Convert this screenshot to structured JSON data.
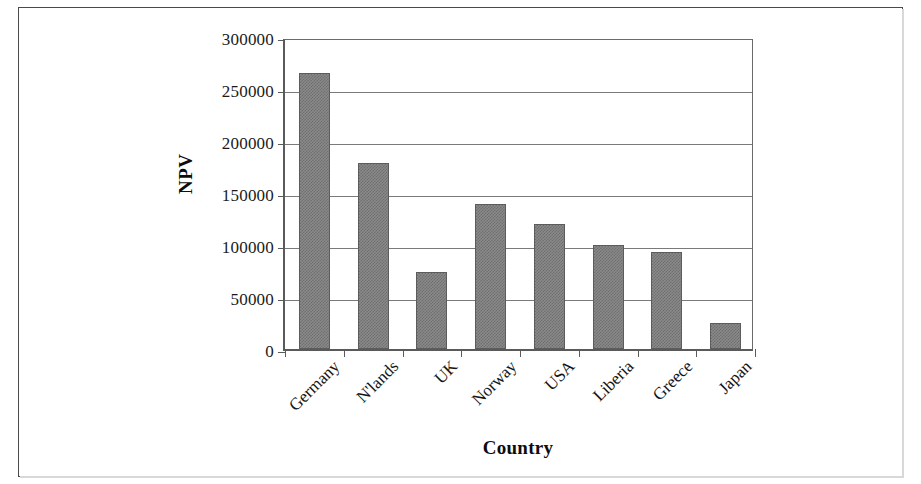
{
  "chart_data": {
    "type": "bar",
    "title": "",
    "subtitle": "",
    "xlabel": "Country",
    "ylabel": "NPV",
    "categories": [
      "Germany",
      "N'lands",
      "UK",
      "Norway",
      "USA",
      "Liberia",
      "Greece",
      "Japan"
    ],
    "values": [
      265000,
      179000,
      74000,
      139000,
      120000,
      100000,
      93000,
      25000
    ],
    "ylim": [
      0,
      300000
    ],
    "ytick_labels": [
      "0",
      "50000",
      "100000",
      "150000",
      "200000",
      "250000",
      "300000"
    ],
    "ytick_values": [
      0,
      50000,
      100000,
      150000,
      200000,
      250000,
      300000
    ],
    "grid": "horizontal",
    "legend": "none",
    "bar_fill_color": "#808080",
    "bar_edge_color": "#5c5c5c",
    "axis_color": "#5a5a5a",
    "grid_color": "#7a7a7a",
    "background_color": "#ffffff",
    "xtick_label_rotation": 45,
    "annotations": []
  },
  "figure": {
    "border_color": "#4a4a4a"
  }
}
